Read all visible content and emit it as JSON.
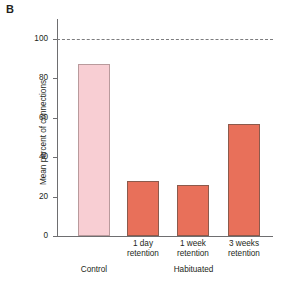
{
  "panel": {
    "letter": "B"
  },
  "chart_data": {
    "type": "bar",
    "title": "",
    "xlabel": "",
    "ylabel": "Mean percent of connections",
    "ylim": [
      0,
      110
    ],
    "yticks": [
      0,
      20,
      40,
      60,
      80,
      100
    ],
    "ytick_labels": [
      "0",
      "20",
      "40",
      "60",
      "80",
      "100"
    ],
    "grid": false,
    "legend": "none",
    "categories": [
      "",
      "1 day retention",
      "1 week retention",
      "3 weeks retention"
    ],
    "category_lines": [
      {
        "line1": "",
        "line2": ""
      },
      {
        "line1": "1 day",
        "line2": "retention"
      },
      {
        "line1": "1 week",
        "line2": "retention"
      },
      {
        "line1": "3 weeks",
        "line2": "retention"
      }
    ],
    "values": [
      87,
      28,
      26,
      57
    ],
    "bar_colors": [
      "#f8ced3",
      "#e8705a",
      "#e8705a",
      "#e8705a"
    ],
    "groups": [
      {
        "label": "Control",
        "members": [
          0
        ]
      },
      {
        "label": "Habituated",
        "members": [
          1,
          2,
          3
        ]
      }
    ],
    "annotations": [
      {
        "type": "dashed-reference-line",
        "value": 100,
        "label": "100% baseline"
      }
    ]
  }
}
